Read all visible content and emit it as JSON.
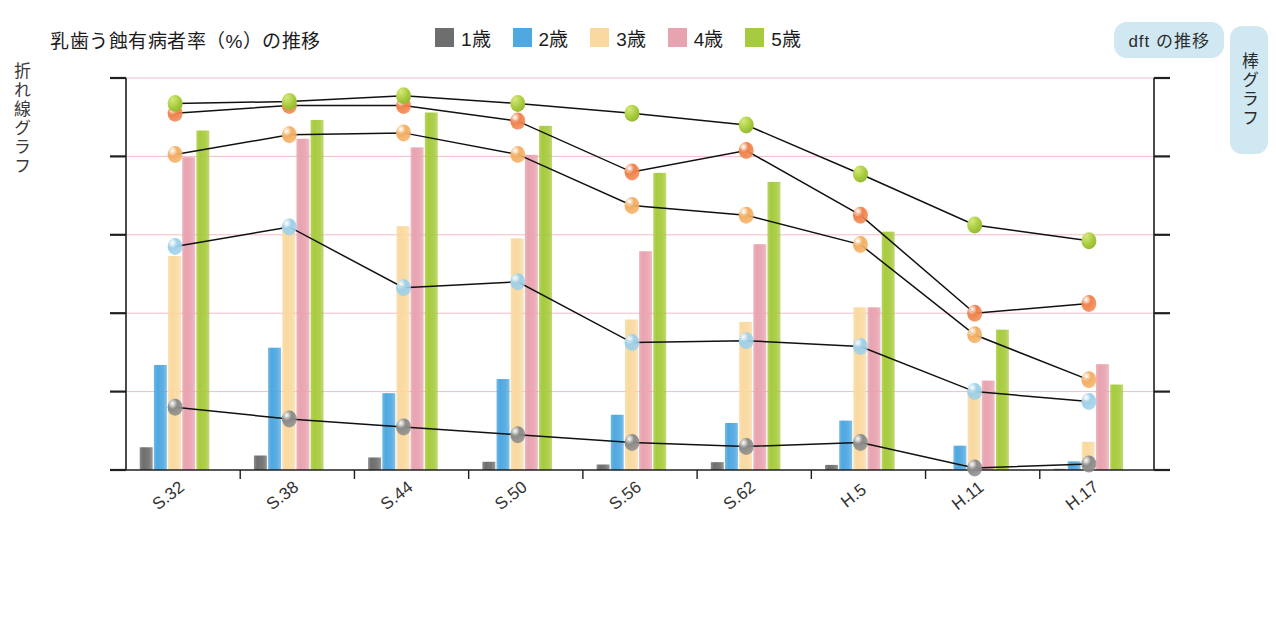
{
  "header": {
    "title": "乳歯う蝕有病者率（%）の推移",
    "dft_badge": "dft の推移",
    "left_axis_caption": "折れ線グラフ",
    "right_axis_caption": "棒グラフ"
  },
  "legend": {
    "items": [
      {
        "label": "1歳",
        "color": "#6E6E6E"
      },
      {
        "label": "2歳",
        "color": "#4FA8E0"
      },
      {
        "label": "3歳",
        "color": "#F9D9A0"
      },
      {
        "label": "4歳",
        "color": "#E8A3B0"
      },
      {
        "label": "5歳",
        "color": "#A7CB3E"
      }
    ]
  },
  "chart_data": {
    "type": "bar",
    "title": "乳歯う蝕有病者率（%）の推移",
    "xlabel": "",
    "ylabel": "乳歯う蝕有病者率（%）",
    "y2label": "dft",
    "ylim": [
      0,
      100
    ],
    "y2lim": [
      0,
      10
    ],
    "yticks": [
      "0",
      "20",
      "40",
      "60",
      "80",
      "100"
    ],
    "y2ticks": [
      "0",
      "2",
      "4",
      "6",
      "8",
      "10"
    ],
    "grid": true,
    "legend_position": "top",
    "categories": [
      "S.32",
      "S.38",
      "S.44",
      "S.50",
      "S.56",
      "S.62",
      "H.5",
      "H.11",
      "H.17"
    ],
    "bar_series": [
      {
        "name": "1歳",
        "color": "#6E6E6E",
        "axis": "left",
        "values": [
          5.8,
          3.7,
          3.2,
          2.1,
          1.4,
          2.0,
          1.3,
          0.2,
          0.3
        ]
      },
      {
        "name": "2歳",
        "color": "#4FA8E0",
        "axis": "left",
        "values": [
          26.8,
          31.2,
          19.6,
          23.2,
          14.1,
          12.0,
          12.6,
          6.2,
          2.2
        ]
      },
      {
        "name": "3歳",
        "color": "#F9D9A0",
        "axis": "left",
        "values": [
          54.6,
          61.0,
          62.2,
          59.1,
          38.4,
          37.8,
          41.5,
          20.0,
          7.2
        ]
      },
      {
        "name": "4歳",
        "color": "#E8A3B0",
        "axis": "left",
        "values": [
          79.8,
          84.5,
          82.3,
          80.4,
          55.8,
          57.6,
          41.5,
          22.8,
          27.0
        ]
      },
      {
        "name": "5歳",
        "color": "#A7CB3E",
        "axis": "left",
        "values": [
          86.6,
          89.3,
          91.2,
          87.8,
          75.8,
          73.5,
          60.8,
          35.8,
          21.8
        ]
      }
    ],
    "line_series": [
      {
        "name": "1歳",
        "marker_color": "#8B8B8B",
        "axis": "right",
        "values": [
          1.6,
          1.3,
          1.1,
          0.9,
          0.7,
          0.6,
          0.7,
          0.05,
          0.15
        ]
      },
      {
        "name": "2歳",
        "marker_color": "#9FD0E8",
        "axis": "right",
        "values": [
          5.7,
          6.2,
          4.65,
          4.8,
          3.25,
          3.3,
          3.15,
          2.0,
          1.75
        ]
      },
      {
        "name": "3歳",
        "marker_color": "#F3AF63",
        "axis": "right",
        "values": [
          8.05,
          8.55,
          8.6,
          8.05,
          6.75,
          6.5,
          5.75,
          3.45,
          2.3
        ]
      },
      {
        "name": "4歳",
        "marker_color": "#F0834C",
        "axis": "right",
        "values": [
          9.1,
          9.3,
          9.3,
          8.9,
          7.6,
          8.15,
          6.5,
          4.0,
          4.25
        ]
      },
      {
        "name": "5歳",
        "marker_color": "#A7CB3E",
        "axis": "right",
        "values": [
          9.35,
          9.4,
          9.55,
          9.35,
          9.1,
          8.8,
          7.55,
          6.25,
          5.85
        ]
      }
    ]
  }
}
